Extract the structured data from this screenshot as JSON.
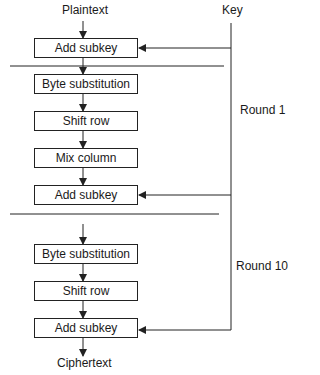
{
  "diagram": {
    "input_label": "Plaintext",
    "output_label": "Ciphertext",
    "key_label": "Key",
    "round1_label": "Round 1",
    "round10_label": "Round 10",
    "steps": [
      {
        "label": "Add subkey"
      },
      {
        "label": "Byte substitution"
      },
      {
        "label": "Shift row"
      },
      {
        "label": "Mix column"
      },
      {
        "label": "Add subkey"
      },
      {
        "label": "Byte substitution"
      },
      {
        "label": "Shift row"
      },
      {
        "label": "Add subkey"
      }
    ]
  }
}
